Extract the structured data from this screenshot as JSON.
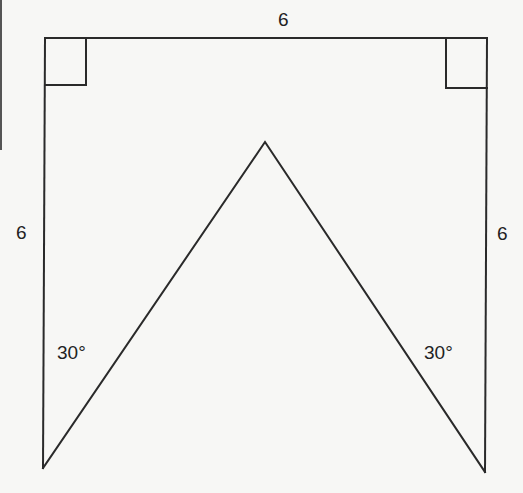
{
  "figure": {
    "type": "geometry-diagram",
    "labels": {
      "top_side": "6",
      "left_side": "6",
      "right_side": "6",
      "left_angle": "30°",
      "right_angle": "30°"
    },
    "stroke_color": "#2a2a2a",
    "background_color": "#f7f7f5"
  }
}
